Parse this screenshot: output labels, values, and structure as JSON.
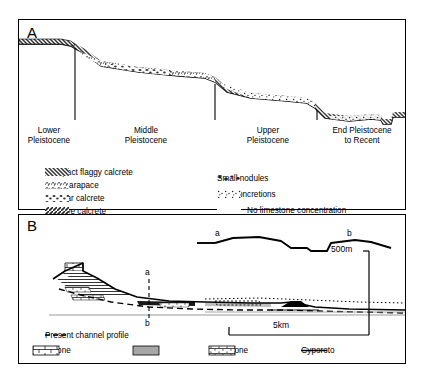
{
  "figure": {
    "panel_a": {
      "letter": "A",
      "stages": [
        {
          "label_line1": "Lower",
          "label_line2": "Pleistocene"
        },
        {
          "label_line1": "Middle",
          "label_line2": "Pleistocene"
        },
        {
          "label_line1": "Upper",
          "label_line2": "Pleistocene"
        },
        {
          "label_line1": "End Pleistocene",
          "label_line2": "to Recent"
        }
      ],
      "legend_left": [
        {
          "pattern": "compact-flaggy-calcrete-swatch",
          "label": "Compact flaggy calcrete"
        },
        {
          "pattern": "hard-carapace-swatch",
          "label": "Hard carapace"
        },
        {
          "pattern": "nodular-calcrete-swatch",
          "label": "Nodular calcrete"
        },
        {
          "pattern": "massive-calcrete-swatch",
          "label": "Massive calcrete"
        }
      ],
      "legend_right": [
        {
          "pattern": "small-nodules-swatch",
          "label": "Small nodules"
        },
        {
          "pattern": "soft-concretions-swatch",
          "label": "Soft concretions"
        },
        {
          "pattern": "blank-swatch",
          "label": "No limestone concentration"
        }
      ]
    },
    "panel_b": {
      "letter": "B",
      "section_markers": {
        "top": "a",
        "bottom": "b"
      },
      "inset_markers": {
        "left": "a",
        "right": "b"
      },
      "scale_vertical": "500m",
      "scale_horizontal": "5km",
      "legend_line": {
        "symbol": "dashed-line",
        "label": "Present channel profile"
      },
      "legend_units": [
        {
          "pattern": "limestone-swatch",
          "label": "Limestone"
        },
        {
          "pattern": "marl-swatch",
          "label": "Marl"
        },
        {
          "pattern": "sandstone-swatch",
          "label": "Sandstone"
        },
        {
          "pattern": "gyporoto-line",
          "label": "Gyporoto"
        }
      ]
    }
  },
  "colors": {
    "ink": "#000000",
    "paper": "#ffffff",
    "grey": "#9a9a9a"
  }
}
